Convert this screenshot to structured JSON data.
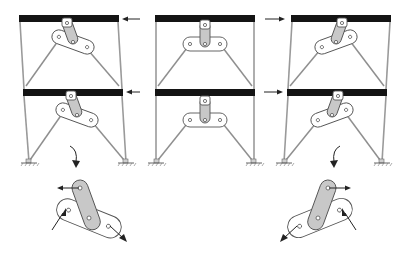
{
  "figure": {
    "panels": [
      {
        "id": "top-left",
        "story": 1,
        "load_direction": "left",
        "link_state": "rotated-clockwise"
      },
      {
        "id": "top-middle",
        "story": 1,
        "load_direction": "none",
        "link_state": "neutral"
      },
      {
        "id": "top-right",
        "story": 1,
        "load_direction": "right",
        "link_state": "rotated-counterclockwise"
      },
      {
        "id": "bottom-left",
        "story": 2,
        "load_direction": "left",
        "link_state": "rotated-clockwise"
      },
      {
        "id": "bottom-middle",
        "story": 2,
        "load_direction": "none",
        "link_state": "neutral"
      },
      {
        "id": "bottom-right",
        "story": 2,
        "load_direction": "right",
        "link_state": "rotated-counterclockwise"
      }
    ],
    "details": [
      {
        "id": "detail-left",
        "refers_to": "bottom-left",
        "force_arrows": [
          "left",
          "lower-right",
          "brace-in"
        ]
      },
      {
        "id": "detail-right",
        "refers_to": "bottom-right",
        "force_arrows": [
          "right",
          "lower-left",
          "brace-in"
        ]
      }
    ],
    "colors": {
      "beam": "#141414",
      "post": "#9a9a9a",
      "link_fill": "#c8c8c8",
      "outline": "#555555",
      "background": "#ffffff"
    }
  }
}
